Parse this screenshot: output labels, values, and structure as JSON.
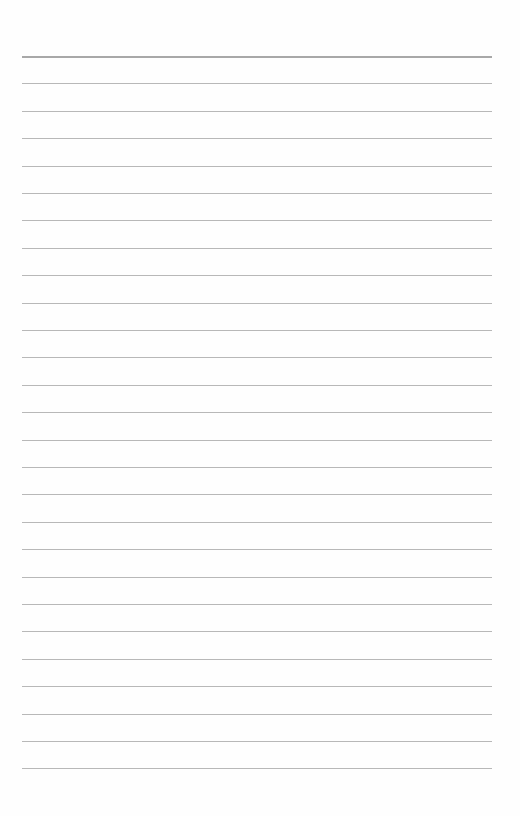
{
  "page": {
    "type": "blank lined paper",
    "line_count": 27,
    "first_line_y": 56,
    "line_spacing": 27.4,
    "line_left": 22,
    "line_width": 470,
    "colors": {
      "background": "#fefefe",
      "rule": "#b8b8b8",
      "top_rule": "#a8a8a8"
    }
  }
}
